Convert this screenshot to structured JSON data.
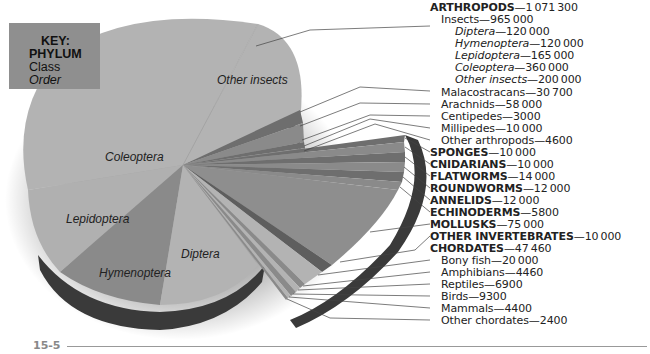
{
  "key": {
    "title": "KEY:",
    "level1": "PHYLUM",
    "level2": "Class",
    "level3": "Order"
  },
  "page_number": "15-5",
  "pie_labels": {
    "other_insects": "Other insects",
    "coleoptera": "Coleoptera",
    "lepidoptera": "Lepidoptera",
    "hymenoptera": "Hymenoptera",
    "diptera": "Diptera"
  },
  "legend": [
    {
      "name": "ARTHROPODS",
      "value": "1071300",
      "level": "phylum"
    },
    {
      "name": "Insects",
      "value": "965000",
      "level": "class"
    },
    {
      "name": "Diptera",
      "value": "120000",
      "level": "order"
    },
    {
      "name": "Hymenoptera",
      "value": "120000",
      "level": "order"
    },
    {
      "name": "Lepidoptera",
      "value": "165000",
      "level": "order"
    },
    {
      "name": "Coleoptera",
      "value": "360000",
      "level": "order"
    },
    {
      "name": "Other insects",
      "value": "200000",
      "level": "order"
    },
    {
      "name": "Malacostracans",
      "value": "30700",
      "level": "class"
    },
    {
      "name": "Arachnids",
      "value": "58000",
      "level": "class"
    },
    {
      "name": "Centipedes",
      "value": "3000",
      "level": "class"
    },
    {
      "name": "Millipedes",
      "value": "10000",
      "level": "class"
    },
    {
      "name": "Other arthropods",
      "value": "4600",
      "level": "class"
    },
    {
      "name": "SPONGES",
      "value": "10000",
      "level": "phylum"
    },
    {
      "name": "CNIDARIANS",
      "value": "10000",
      "level": "phylum"
    },
    {
      "name": "FLATWORMS",
      "value": "14000",
      "level": "phylum"
    },
    {
      "name": "ROUNDWORMS",
      "value": "12000",
      "level": "phylum"
    },
    {
      "name": "ANNELIDS",
      "value": "12000",
      "level": "phylum"
    },
    {
      "name": "ECHINODERMS",
      "value": "5800",
      "level": "phylum"
    },
    {
      "name": "MOLLUSKS",
      "value": "75000",
      "level": "phylum"
    },
    {
      "name": "OTHER INVERTEBRATES",
      "value": "10000",
      "level": "phylum"
    },
    {
      "name": "CHORDATES",
      "value": "47460",
      "level": "phylum"
    },
    {
      "name": "Bony fish",
      "value": "20000",
      "level": "class"
    },
    {
      "name": "Amphibians",
      "value": "4460",
      "level": "class"
    },
    {
      "name": "Reptiles",
      "value": "6900",
      "level": "class"
    },
    {
      "name": "Birds",
      "value": "9300",
      "level": "class"
    },
    {
      "name": "Mammals",
      "value": "4400",
      "level": "class"
    },
    {
      "name": "Other chordates",
      "value": "2400",
      "level": "class"
    }
  ],
  "chart_data": {
    "type": "pie",
    "title": "",
    "style": "3D exploded pie, grayscale",
    "legend_position": "right",
    "categories": [
      "Diptera",
      "Hymenoptera",
      "Lepidoptera",
      "Coleoptera",
      "Other insects",
      "Malacostracans",
      "Arachnids",
      "Centipedes",
      "Millipedes",
      "Other arthropods",
      "Sponges",
      "Cnidarians",
      "Flatworms",
      "Roundworms",
      "Annelids",
      "Echinoderms",
      "Mollusks",
      "Other invertebrates",
      "Bony fish",
      "Amphibians",
      "Reptiles",
      "Birds",
      "Mammals",
      "Other chordates"
    ],
    "values": [
      120000,
      120000,
      165000,
      360000,
      200000,
      30700,
      58000,
      3000,
      10000,
      4600,
      10000,
      10000,
      14000,
      12000,
      12000,
      5800,
      75000,
      10000,
      20000,
      4460,
      6900,
      9300,
      4400,
      2400
    ],
    "groups": [
      {
        "name": "ARTHROPODS",
        "total": 1071300,
        "children": [
          {
            "name": "Insects",
            "total": 965000,
            "children": [
              {
                "name": "Diptera",
                "value": 120000
              },
              {
                "name": "Hymenoptera",
                "value": 120000
              },
              {
                "name": "Lepidoptera",
                "value": 165000
              },
              {
                "name": "Coleoptera",
                "value": 360000
              },
              {
                "name": "Other insects",
                "value": 200000
              }
            ]
          },
          {
            "name": "Malacostracans",
            "value": 30700
          },
          {
            "name": "Arachnids",
            "value": 58000
          },
          {
            "name": "Centipedes",
            "value": 3000
          },
          {
            "name": "Millipedes",
            "value": 10000
          },
          {
            "name": "Other arthropods",
            "value": 4600
          }
        ]
      },
      {
        "name": "SPONGES",
        "total": 10000
      },
      {
        "name": "CNIDARIANS",
        "total": 10000
      },
      {
        "name": "FLATWORMS",
        "total": 14000
      },
      {
        "name": "ROUNDWORMS",
        "total": 12000
      },
      {
        "name": "ANNELIDS",
        "total": 12000
      },
      {
        "name": "ECHINODERMS",
        "total": 5800
      },
      {
        "name": "MOLLUSKS",
        "total": 75000
      },
      {
        "name": "OTHER INVERTEBRATES",
        "total": 10000
      },
      {
        "name": "CHORDATES",
        "total": 47460,
        "children": [
          {
            "name": "Bony fish",
            "value": 20000
          },
          {
            "name": "Amphibians",
            "value": 4460
          },
          {
            "name": "Reptiles",
            "value": 6900
          },
          {
            "name": "Birds",
            "value": 9300
          },
          {
            "name": "Mammals",
            "value": 4400
          },
          {
            "name": "Other chordates",
            "value": 2400
          }
        ]
      }
    ],
    "colors": {
      "dark": "#5e5e5e",
      "mid": "#8a8a8a",
      "light": "#b3b3b3",
      "side": "#3a3a3a"
    }
  }
}
